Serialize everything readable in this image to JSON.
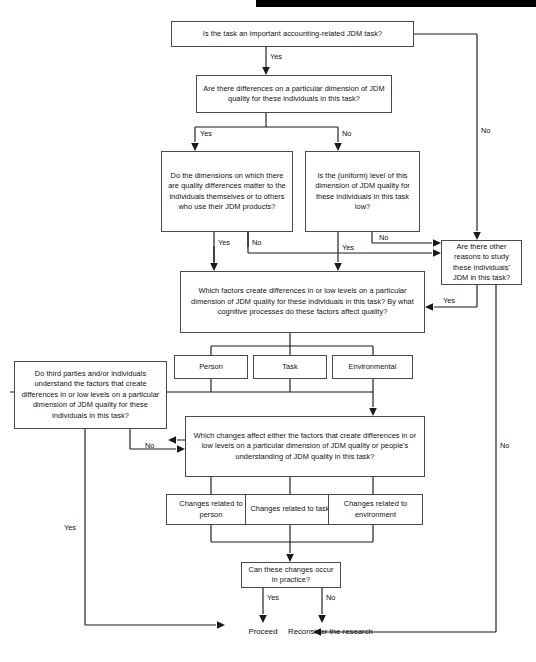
{
  "diagram": {
    "nodes": {
      "q_important_task": "Is the task an important accounting-related JDM task?",
      "q_differences": "Are there differences on a particular dimension of JDM quality for these individuals in this task?",
      "q_dimensions_matter": "Do the dimensions on which there are quality differences matter to the individuals themselves or to others who use their JDM products?",
      "q_uniform_low": "Is the (uniform) level of this dimension of JDM quality for these individuals in this task low?",
      "q_other_reasons": "Are there other reasons to study these individuals' JDM in this task?",
      "q_which_factors": "Which factors create differences in or low levels on a particular dimension of JDM quality for these individuals in this task? By what cognitive processes do these factors affect quality?",
      "factor_person": "Person",
      "factor_task": "Task",
      "factor_environmental": "Environmental",
      "q_third_parties": "Do third parties and/or individuals understand the factors that create differences in or low levels on a particular dimension of JDM quality for these individuals in this task?",
      "q_which_changes": "Which changes affect either the factors that create differences in or low levels on a particular dimension of JDM quality or people's understanding of JDM quality in this task?",
      "changes_person": "Changes related to person",
      "changes_task": "Changes related to task",
      "changes_environment": "Changes related to environment",
      "q_occur_in_practice": "Can these changes occur in practice?"
    },
    "terminals": {
      "proceed": "Proceed",
      "reconsider_line1": "Reconsider",
      "reconsider_line2": "the research"
    },
    "edge_labels": {
      "important_yes": "Yes",
      "important_no": "No",
      "differences_yes": "Yes",
      "differences_no": "No",
      "dimensions_yes": "Yes",
      "dimensions_no": "No",
      "uniform_yes": "Yes",
      "uniform_no": "No",
      "other_reasons_yes": "Yes",
      "other_reasons_no": "No",
      "third_parties_no": "No",
      "third_parties_yes": "Yes",
      "practice_yes": "Yes",
      "practice_no": "No"
    },
    "colors": {
      "line": "#1a1a1a",
      "box_border": "#4a4a4a",
      "background": "#ffffff",
      "topbar": "#000000",
      "text": "#101010"
    }
  }
}
